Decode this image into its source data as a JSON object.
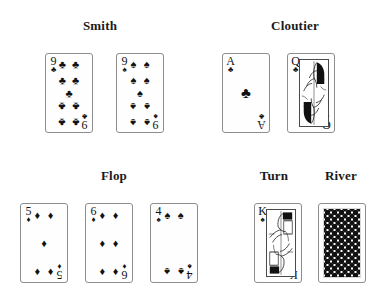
{
  "scene": {
    "title": "Poker hand showdown diagram",
    "background_color": "#ffffff",
    "ink_color": "#111111"
  },
  "labels": {
    "player_one": "Smith",
    "player_two": "Cloutier",
    "flop": "Flop",
    "turn": "Turn",
    "river": "River"
  },
  "suit_glyphs": {
    "clubs": "♣",
    "spades": "♠",
    "hearts": "♥",
    "diamonds": "♦"
  },
  "hands": {
    "smith": [
      {
        "rank": "9",
        "suit": "clubs",
        "suit_glyph": "♣",
        "face_up": true,
        "pip_count": 9
      },
      {
        "rank": "9",
        "suit": "spades",
        "suit_glyph": "♠",
        "face_up": true,
        "pip_count": 9
      }
    ],
    "cloutier": [
      {
        "rank": "A",
        "suit": "clubs",
        "suit_glyph": "♣",
        "face_up": true,
        "pip_count": 1
      },
      {
        "rank": "Q",
        "suit": "clubs",
        "suit_glyph": "♣",
        "face_up": true,
        "court": true
      }
    ]
  },
  "community": {
    "flop": [
      {
        "rank": "5",
        "suit": "diamonds",
        "suit_glyph": "♦",
        "face_up": true,
        "pip_count": 5
      },
      {
        "rank": "6",
        "suit": "diamonds",
        "suit_glyph": "♦",
        "face_up": true,
        "pip_count": 6
      },
      {
        "rank": "4",
        "suit": "spades",
        "suit_glyph": "♠",
        "face_up": true,
        "pip_count": 4
      }
    ],
    "turn": [
      {
        "rank": "K",
        "suit": "spades",
        "suit_glyph": "♠",
        "face_up": true,
        "court": true
      }
    ],
    "river": [
      {
        "rank": "",
        "suit": "",
        "suit_glyph": "",
        "face_up": false,
        "back_pattern": "diamond-lattice"
      }
    ]
  }
}
